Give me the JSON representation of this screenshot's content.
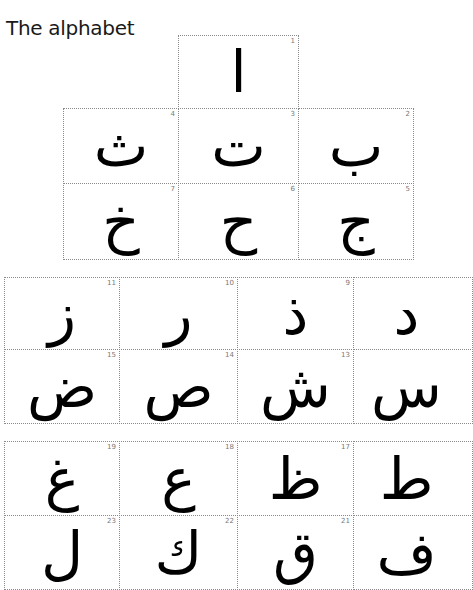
{
  "title": "The alphabet",
  "letters": [
    {
      "n": "1",
      "ch": "ا"
    },
    {
      "n": "2",
      "ch": "ب"
    },
    {
      "n": "3",
      "ch": "ت"
    },
    {
      "n": "4",
      "ch": "ث"
    },
    {
      "n": "5",
      "ch": "ج"
    },
    {
      "n": "6",
      "ch": "ح"
    },
    {
      "n": "7",
      "ch": "خ"
    },
    {
      "n": "8",
      "ch": "د"
    },
    {
      "n": "9",
      "ch": "ذ"
    },
    {
      "n": "10",
      "ch": "ر"
    },
    {
      "n": "11",
      "ch": "ز"
    },
    {
      "n": "12",
      "ch": "س"
    },
    {
      "n": "13",
      "ch": "ش"
    },
    {
      "n": "14",
      "ch": "ص"
    },
    {
      "n": "15",
      "ch": "ض"
    },
    {
      "n": "16",
      "ch": "ط"
    },
    {
      "n": "17",
      "ch": "ظ"
    },
    {
      "n": "18",
      "ch": "ع"
    },
    {
      "n": "19",
      "ch": "غ"
    },
    {
      "n": "20",
      "ch": "ف"
    },
    {
      "n": "21",
      "ch": "ق"
    },
    {
      "n": "22",
      "ch": "ك"
    },
    {
      "n": "23",
      "ch": "ل"
    }
  ]
}
